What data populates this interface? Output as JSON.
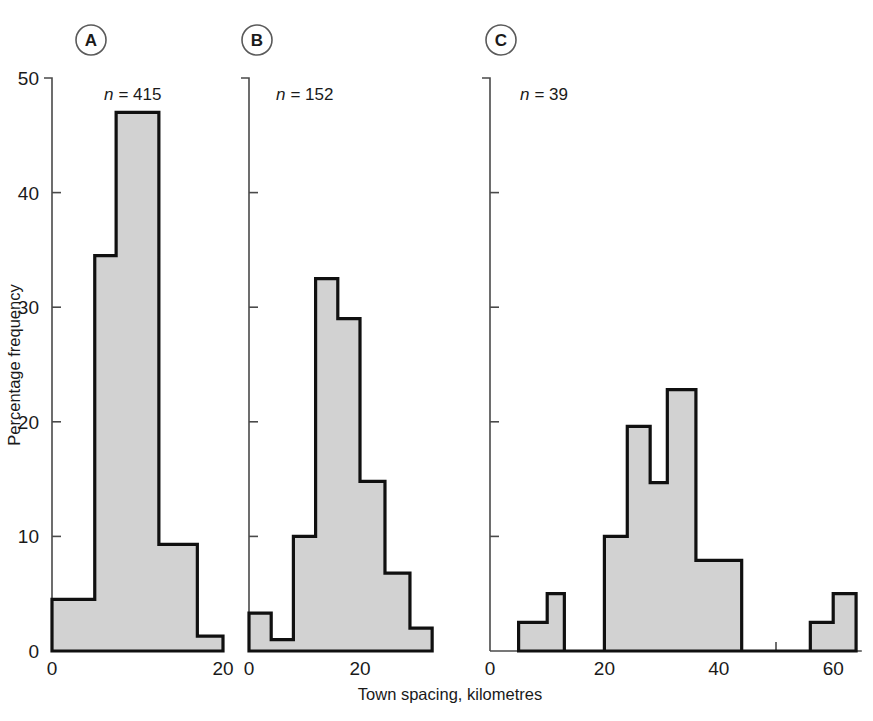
{
  "figure": {
    "xlabel": "Town spacing, kilometres",
    "ylabel": "Percentage frequency"
  },
  "panels": [
    {
      "badge": "A",
      "n_prefix": "n",
      "n_eq": "= 415",
      "n_label": "n = 415",
      "x_ticks": [
        "0",
        "",
        "20"
      ],
      "x_tick_values": [
        0,
        10,
        20
      ],
      "x_tick_labeled": [
        true,
        false,
        true
      ]
    },
    {
      "badge": "B",
      "n_prefix": "n",
      "n_eq": "= 152",
      "n_label": "n = 152",
      "x_ticks": [
        "0",
        "",
        "20",
        ""
      ],
      "x_tick_values": [
        0,
        10,
        20,
        30
      ],
      "x_tick_labeled": [
        true,
        false,
        true,
        false
      ]
    },
    {
      "badge": "C",
      "n_prefix": "n",
      "n_eq": "= 39",
      "n_label": "n = 39",
      "x_ticks": [
        "0",
        "",
        "20",
        "",
        "40",
        "",
        "60"
      ],
      "x_tick_values": [
        0,
        10,
        20,
        30,
        40,
        50,
        60
      ],
      "x_tick_labeled": [
        true,
        false,
        true,
        false,
        true,
        false,
        true
      ]
    }
  ],
  "y_axis": {
    "ticks": [
      "0",
      "10",
      "20",
      "30",
      "40",
      "50"
    ],
    "tick_values": [
      0,
      10,
      20,
      30,
      40,
      50
    ],
    "min": 0,
    "max": 50,
    "label": "Percentage frequency"
  },
  "colors": {
    "bar_fill": "#d2d2d2",
    "bar_stroke": "#101010",
    "axis": "#4a4a4a",
    "text": "#1a1a1a",
    "background": "#ffffff"
  },
  "chart_data": [
    {
      "type": "bar",
      "title": "A",
      "subtitle": "n = 415",
      "n": 415,
      "xlabel": "Town spacing, kilometres",
      "ylabel": "Percentage frequency",
      "xlim": [
        0,
        20
      ],
      "ylim": [
        0,
        50
      ],
      "grid": false,
      "legend": "none",
      "bin_width": 2.5,
      "bin_edges": [
        0,
        2.5,
        5,
        7.5,
        10,
        12.5,
        15,
        17.5,
        20
      ],
      "categories": [
        "0-2.5",
        "2.5-5",
        "5-7.5",
        "7.5-10",
        "10-12.5",
        "12.5-15",
        "15-17.5",
        "17.5-20"
      ],
      "values": [
        4.5,
        4.5,
        34.5,
        34.5,
        47,
        47,
        9.3,
        1.3
      ],
      "bars": [
        {
          "x0": 0,
          "x1": 5,
          "y": 4.5
        },
        {
          "x0": 5,
          "x1": 7.5,
          "y": 34.5
        },
        {
          "x0": 7.5,
          "x1": 12.5,
          "y": 47
        },
        {
          "x0": 12.5,
          "x1": 17,
          "y": 9.3
        },
        {
          "x0": 17,
          "x1": 20,
          "y": 1.3
        }
      ]
    },
    {
      "type": "bar",
      "title": "B",
      "subtitle": "n = 152",
      "n": 152,
      "xlabel": "Town spacing, kilometres",
      "ylabel": "Percentage frequency",
      "xlim": [
        0,
        33
      ],
      "ylim": [
        0,
        50
      ],
      "grid": false,
      "legend": "none",
      "bin_width": 4,
      "bin_edges": [
        0,
        4,
        8,
        12,
        16,
        20,
        24,
        28,
        33
      ],
      "categories": [
        "0-4",
        "4-8",
        "8-12",
        "12-16",
        "16-20",
        "20-24",
        "24-28",
        "28-33"
      ],
      "values": [
        3.3,
        1.0,
        10.0,
        32.5,
        29.0,
        14.8,
        6.8,
        2.0
      ],
      "bars": [
        {
          "x0": 0,
          "x1": 4,
          "y": 3.3
        },
        {
          "x0": 4,
          "x1": 8,
          "y": 1.0
        },
        {
          "x0": 8,
          "x1": 12,
          "y": 10.0
        },
        {
          "x0": 12,
          "x1": 16,
          "y": 32.5
        },
        {
          "x0": 16,
          "x1": 20,
          "y": 29.0
        },
        {
          "x0": 20,
          "x1": 24.5,
          "y": 14.8
        },
        {
          "x0": 24.5,
          "x1": 29,
          "y": 6.8
        },
        {
          "x0": 29,
          "x1": 33,
          "y": 2.0
        }
      ]
    },
    {
      "type": "bar",
      "title": "C",
      "subtitle": "n = 39",
      "n": 39,
      "xlabel": "Town spacing, kilometres",
      "ylabel": "Percentage frequency",
      "xlim": [
        0,
        65
      ],
      "ylim": [
        0,
        50
      ],
      "grid": false,
      "legend": "none",
      "bin_width": 5,
      "bin_edges": [
        0,
        5,
        10,
        15,
        20,
        25,
        30,
        35,
        40,
        45,
        50,
        55,
        60,
        65
      ],
      "categories": [
        "0-5",
        "5-10",
        "10-15",
        "15-20",
        "20-25",
        "25-30",
        "30-35",
        "35-40",
        "40-45",
        "45-50",
        "50-55",
        "55-60",
        "60-65"
      ],
      "values": [
        0,
        2.5,
        5.0,
        0,
        10.0,
        19.6,
        14.7,
        22.8,
        7.9,
        0,
        0,
        2.5,
        5.0
      ],
      "bars": [
        {
          "x0": 5,
          "x1": 10,
          "y": 2.5
        },
        {
          "x0": 10,
          "x1": 13,
          "y": 5.0
        },
        {
          "x0": 20,
          "x1": 24,
          "y": 10.0
        },
        {
          "x0": 24,
          "x1": 28,
          "y": 19.6
        },
        {
          "x0": 28,
          "x1": 31,
          "y": 14.7
        },
        {
          "x0": 31,
          "x1": 36,
          "y": 22.8
        },
        {
          "x0": 36,
          "x1": 44,
          "y": 7.9
        },
        {
          "x0": 56,
          "x1": 60,
          "y": 2.5
        },
        {
          "x0": 60,
          "x1": 64,
          "y": 5.0
        }
      ]
    }
  ]
}
